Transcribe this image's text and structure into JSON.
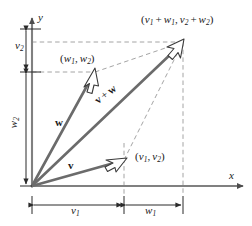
{
  "figure": {
    "background_color": "#ffffff",
    "vector_color": "#6b6b6b",
    "axis_color": "#808080",
    "dash_color": "#9a9a9a",
    "text_color": "#1a1a1a",
    "width": 252,
    "height": 226
  },
  "axes": {
    "x_label": "x",
    "y_label": "y",
    "origin": {
      "x": 32,
      "y": 186
    }
  },
  "vectors": [
    {
      "id": "w",
      "name": "w",
      "label": "w",
      "from": {
        "x": 32,
        "y": 186
      },
      "to": {
        "x": 95,
        "y": 72
      },
      "tip_point_label_parts": {
        "open": "(",
        "a": "w",
        "a_sub": "1",
        "comma": ",",
        "b": "w",
        "b_sub": "2",
        "close": ")"
      }
    },
    {
      "id": "v",
      "name": "v",
      "label": "v",
      "from": {
        "x": 32,
        "y": 186
      },
      "to": {
        "x": 124,
        "y": 160
      },
      "tip_point_label_parts": {
        "open": "(",
        "a": "v",
        "a_sub": "1",
        "comma": ",",
        "b": "v",
        "b_sub": "2",
        "close": ")"
      }
    },
    {
      "id": "v-plus-w",
      "name": "v + w",
      "label_v": "v",
      "label_plus": "+",
      "label_w": "w",
      "from": {
        "x": 32,
        "y": 186
      },
      "to": {
        "x": 183,
        "y": 42
      }
    }
  ],
  "point_labels": {
    "sum": {
      "open": "(",
      "v1": "v",
      "v1_sub": "1",
      "plus1": "+",
      "w1": "w",
      "w1_sub": "1",
      "comma": ",",
      "v2": "v",
      "v2_sub": "2",
      "plus2": "+",
      "w2": "w",
      "w2_sub": "2",
      "close": ")"
    },
    "w_point": {
      "open": "(",
      "a": "w",
      "a_sub": "1",
      "comma": ",",
      "b": "w",
      "b_sub": "2",
      "close": ")"
    },
    "v_point": {
      "open": "(",
      "a": "v",
      "a_sub": "1",
      "comma": ",",
      "b": "v",
      "b_sub": "2",
      "close": ")"
    }
  },
  "measurements": {
    "v2": {
      "var": "v",
      "sub": "2",
      "orientation": "vertical"
    },
    "w2": {
      "var": "w",
      "sub": "2",
      "orientation": "vertical"
    },
    "v1": {
      "var": "v",
      "sub": "1",
      "orientation": "horizontal"
    },
    "w1": {
      "var": "w",
      "sub": "1",
      "orientation": "horizontal"
    }
  }
}
